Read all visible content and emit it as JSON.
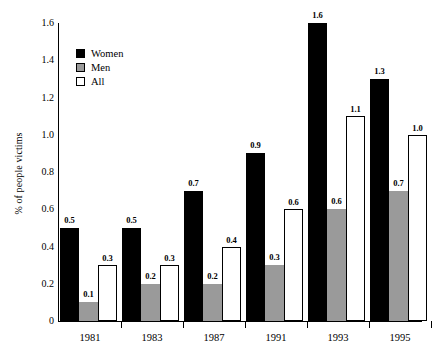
{
  "chart_data": {
    "type": "bar",
    "title": "",
    "xlabel": "",
    "ylabel": "% of people victims",
    "categories": [
      "1981",
      "1983",
      "1987",
      "1991",
      "1993",
      "1995"
    ],
    "series": [
      {
        "name": "Women",
        "color": "#000000",
        "values": [
          0.5,
          0.5,
          0.7,
          0.9,
          1.6,
          1.3
        ]
      },
      {
        "name": "Men",
        "color": "#9a9a9a",
        "values": [
          0.1,
          0.2,
          0.2,
          0.3,
          0.6,
          0.7
        ]
      },
      {
        "name": "All",
        "color": "#ffffff",
        "values": [
          0.3,
          0.3,
          0.4,
          0.6,
          1.1,
          1.0
        ]
      }
    ],
    "value_labels": [
      [
        "0.5",
        "0.1",
        "0.3"
      ],
      [
        "0.5",
        "0.2",
        "0.3"
      ],
      [
        "0.7",
        "0.2",
        "0.4"
      ],
      [
        "0.9",
        "0.3",
        "0.6"
      ],
      [
        "1.6",
        "0.6",
        "1.1"
      ],
      [
        "1.3",
        "0.7",
        "1.0"
      ]
    ],
    "ylim": [
      0,
      1.6
    ],
    "yticks": [
      0,
      0.2,
      0.4,
      0.6,
      0.8,
      1.0,
      1.2,
      1.4,
      1.6
    ],
    "ytick_labels": [
      "0",
      "0.2",
      "0.4",
      "0.6",
      "0.8",
      "1.0",
      "1.2",
      "1.4",
      "1.6"
    ],
    "grid": false,
    "legend_position": "upper-left",
    "legend_entries": [
      "Women",
      "Men",
      "All"
    ]
  }
}
